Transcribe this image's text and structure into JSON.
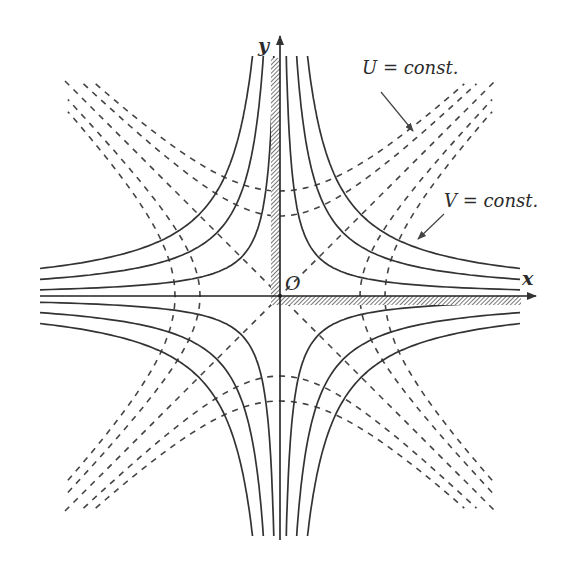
{
  "figure": {
    "type": "conformal-map-level-curves",
    "origin_px": [
      280,
      296
    ],
    "axes": {
      "x_label": "x",
      "y_label": "y",
      "origin_label": "O",
      "x_range_px": [
        40,
        536
      ],
      "y_range_px": [
        36,
        540
      ]
    },
    "solid_curves": {
      "name": "V = const. (xy = c)",
      "levels_px2": [
        1500,
        4000,
        6600
      ],
      "max_extent_px": 240,
      "color": "#333333"
    },
    "dashed_curves": {
      "name": "U = const. (x² − y² = c)",
      "vertices_px": [
        80,
        105
      ],
      "max_radius_px": 300,
      "diagonal_half_length_px": 215,
      "color": "#444444"
    },
    "hatched_boundary": {
      "description": "first-quadrant boundary (positive x and y axes)",
      "color": "#555555"
    },
    "annotations": [
      {
        "label": "U = const.",
        "text_pos": [
          362,
          72
        ],
        "arrow_from": [
          381,
          92
        ],
        "arrow_to": [
          413,
          131
        ]
      },
      {
        "label": "V = const.",
        "text_pos": [
          448,
          206
        ],
        "arrow_from": [
          444,
          212
        ],
        "arrow_to": [
          418,
          239
        ]
      }
    ]
  }
}
